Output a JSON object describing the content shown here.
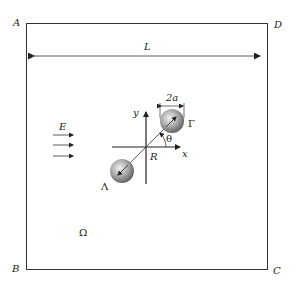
{
  "diagram": {
    "corners": {
      "top_left": "A",
      "top_right": "D",
      "bottom_left": "B",
      "bottom_right": "C"
    },
    "width_label": "L",
    "field_label": "E",
    "domain_label": "Ω",
    "origin_label": "R",
    "x_axis_label": "x",
    "y_axis_label": "y",
    "angle_label": "θ",
    "diameter_label": "2a",
    "particle_upper_label": "Γ",
    "particle_lower_label": "Λ",
    "colors": {
      "line": "#333333",
      "particle_light": "#e6e6e6",
      "particle_dark": "#6a6a6a"
    }
  }
}
